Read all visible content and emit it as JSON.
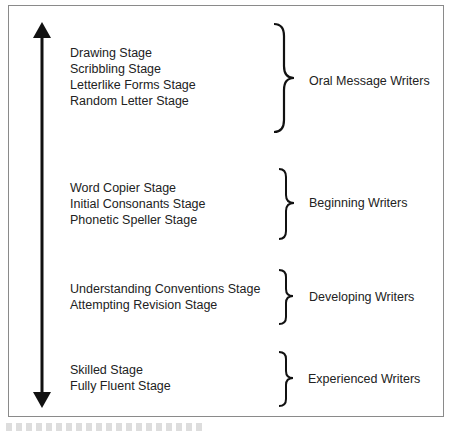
{
  "diagram": {
    "axis": {
      "direction": "bidirectional-vertical",
      "color": "#111111"
    },
    "groups": [
      {
        "label": "Oral Message Writers",
        "stages": [
          "Drawing Stage",
          "Scribbling Stage",
          "Letterlike Forms Stage",
          "Random Letter Stage"
        ]
      },
      {
        "label": "Beginning Writers",
        "stages": [
          "Word Copier Stage",
          "Initial Consonants Stage",
          "Phonetic Speller Stage"
        ]
      },
      {
        "label": "Developing Writers",
        "stages": [
          "Understanding Conventions Stage",
          "Attempting Revision Stage"
        ]
      },
      {
        "label": "Experienced Writers",
        "stages": [
          "Skilled Stage",
          "Fully Fluent Stage"
        ]
      }
    ]
  }
}
